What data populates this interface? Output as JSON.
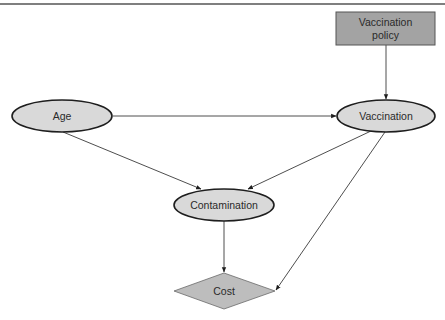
{
  "diagram": {
    "type": "influence-diagram",
    "nodes": [
      {
        "id": "vaccination_policy",
        "label_line1": "Vaccination",
        "label_line2": "policy",
        "shape": "rectangle",
        "role": "decision",
        "fill": "#a3a3a3"
      },
      {
        "id": "age",
        "label": "Age",
        "shape": "ellipse",
        "role": "chance",
        "fill": "#d9d9d9"
      },
      {
        "id": "vaccination",
        "label": "Vaccination",
        "shape": "ellipse",
        "role": "chance",
        "fill": "#d9d9d9"
      },
      {
        "id": "contamination",
        "label": "Contamination",
        "shape": "ellipse",
        "role": "chance",
        "fill": "#d9d9d9"
      },
      {
        "id": "cost",
        "label": "Cost",
        "shape": "diamond",
        "role": "utility",
        "fill": "#bdbdbd"
      }
    ],
    "edges": [
      {
        "from": "vaccination_policy",
        "to": "vaccination"
      },
      {
        "from": "age",
        "to": "vaccination"
      },
      {
        "from": "age",
        "to": "contamination"
      },
      {
        "from": "vaccination",
        "to": "contamination"
      },
      {
        "from": "contamination",
        "to": "cost"
      },
      {
        "from": "vaccination",
        "to": "cost"
      }
    ]
  }
}
